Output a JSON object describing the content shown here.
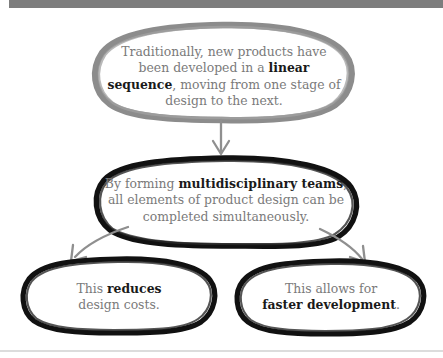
{
  "diagram": {
    "colors": {
      "top_bar": "#7d7d7d",
      "bottom_rule": "#dcdcdc",
      "ellipse_gray": "#8c8c8c",
      "ellipse_black": "#111111",
      "arrow_gray": "#8c8c8c",
      "body_text": "#7a7a7a",
      "emphasis_text": "#1a1a1a",
      "background": "#ffffff"
    },
    "nodes": [
      {
        "id": "node1",
        "outline": "gray",
        "text_plain": "Traditionally, new products have been developed in a linear sequence, moving from one stage of design to the next.",
        "text_html": "Traditionally, new products have been developed in a <b>linear sequence</b>, moving from one stage of design to the next."
      },
      {
        "id": "node2",
        "outline": "black",
        "text_plain": "By forming multidisciplinary teams, all elements of product design can be completed simultaneously.",
        "text_html": "By forming <b>multidisciplinary teams</b>, all elements of product design can be completed simultaneously."
      },
      {
        "id": "node3",
        "outline": "black",
        "text_plain": "This reduces design costs.",
        "text_html": "This <b>reduces</b><br>design costs."
      },
      {
        "id": "node4",
        "outline": "black",
        "text_plain": "This allows for faster development.",
        "text_html": "This allows for<br><b>faster development</b>."
      }
    ],
    "connectors": [
      {
        "id": "arrow-down",
        "from": "node1",
        "to": "node2",
        "style": "straight-down",
        "color": "#8c8c8c"
      },
      {
        "id": "arrow-left",
        "from": "node2",
        "to": "node3",
        "style": "curve-down-left",
        "color": "#8c8c8c"
      },
      {
        "id": "arrow-right",
        "from": "node2",
        "to": "node4",
        "style": "curve-down-right",
        "color": "#8c8c8c"
      }
    ]
  }
}
